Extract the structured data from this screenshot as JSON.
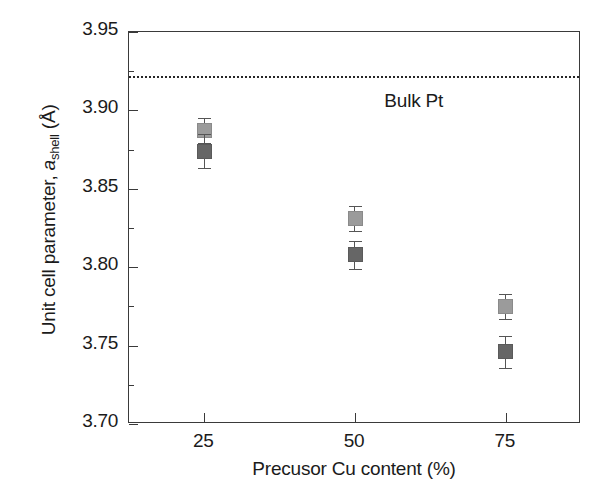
{
  "chart_data": {
    "type": "scatter",
    "title": "",
    "xlabel": "Precusor Cu content (%)",
    "ylabel": "Unit cell parameter, a_shell (Å)",
    "ylabel_parts": {
      "prefix": "Unit cell parameter, ",
      "italic": "a",
      "subscript": "shell",
      "suffix": " (Å)"
    },
    "xlim": [
      12.5,
      87.5
    ],
    "ylim": [
      3.7,
      3.95
    ],
    "grid": false,
    "legend": "none",
    "x_ticks": [
      25,
      50,
      75
    ],
    "x_tick_labels": [
      "25",
      "50",
      "75"
    ],
    "y_ticks": [
      3.7,
      3.75,
      3.8,
      3.85,
      3.9,
      3.95
    ],
    "y_tick_labels": [
      "3.70",
      "3.75",
      "3.80",
      "3.85",
      "3.90",
      "3.95"
    ],
    "y_minor_ticks": [
      3.725,
      3.775,
      3.825,
      3.875,
      3.925
    ],
    "categories": [
      25,
      50,
      75
    ],
    "series": [
      {
        "name": "light-gray-series",
        "color": "#9b9b9b",
        "marker": "square",
        "x": [
          25,
          50,
          75
        ],
        "values": [
          3.887,
          3.831,
          3.775
        ],
        "errors": [
          0.008,
          0.008,
          0.008
        ]
      },
      {
        "name": "dark-gray-series",
        "color": "#666666",
        "marker": "square",
        "x": [
          25,
          50,
          75
        ],
        "values": [
          3.874,
          3.808,
          3.746
        ],
        "errors": [
          0.011,
          0.009,
          0.01
        ]
      }
    ],
    "annotations": [
      {
        "name": "bulk-pt-reference",
        "label": "Bulk Pt",
        "type": "hline",
        "y": 3.922,
        "style": "dotted",
        "color": "#262626"
      }
    ]
  },
  "axis": {
    "y_label_0": "3.70",
    "y_label_1": "3.75",
    "y_label_2": "3.80",
    "y_label_3": "3.85",
    "y_label_4": "3.90",
    "y_label_5": "3.95",
    "x_label_0": "25",
    "x_label_1": "50",
    "x_label_2": "75"
  }
}
